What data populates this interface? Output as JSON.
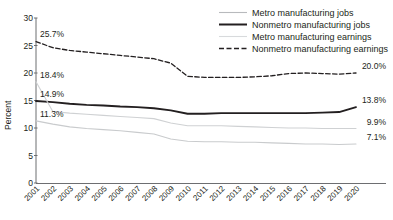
{
  "chart_data": {
    "type": "line",
    "title": "",
    "xlabel": "",
    "ylabel": "Percent",
    "ylim": [
      0,
      30
    ],
    "yticks": [
      0,
      5,
      10,
      15,
      20,
      25,
      30
    ],
    "grid": false,
    "legend_position": "top-right",
    "x": [
      2001,
      2002,
      2003,
      2004,
      2005,
      2006,
      2007,
      2008,
      2009,
      2010,
      2011,
      2012,
      2013,
      2014,
      2015,
      2016,
      2017,
      2018,
      2019,
      2020
    ],
    "series": [
      {
        "name": "Metro manufacturing jobs",
        "style": "solid-light-gray",
        "color": "#c9cbcd",
        "start_label": "11.3%",
        "end_label": "7.1%",
        "values": [
          11.3,
          10.7,
          10.2,
          9.9,
          9.7,
          9.5,
          9.2,
          8.9,
          8.0,
          7.6,
          7.5,
          7.5,
          7.4,
          7.4,
          7.3,
          7.2,
          7.1,
          7.1,
          7.0,
          7.1
        ]
      },
      {
        "name": "Nonmetro manufacturing jobs",
        "style": "solid-bold-black",
        "color": "#231f20",
        "start_label": "14.9%",
        "end_label": "13.8%",
        "values": [
          14.9,
          14.7,
          14.4,
          14.2,
          14.1,
          13.9,
          13.8,
          13.6,
          13.2,
          12.6,
          12.6,
          12.7,
          12.7,
          12.7,
          12.7,
          12.7,
          12.7,
          12.8,
          12.9,
          13.8
        ]
      },
      {
        "name": "Metro manufacturing earnings",
        "style": "solid-gray",
        "color": "#b3b5b8",
        "start_label": "18.4%",
        "end_label": "9.9%",
        "values": [
          18.4,
          13.0,
          12.7,
          12.5,
          12.3,
          12.1,
          11.9,
          11.7,
          10.9,
          10.4,
          10.4,
          10.4,
          10.3,
          10.2,
          10.1,
          10.0,
          10.0,
          9.9,
          9.9,
          9.9
        ]
      },
      {
        "name": "Nonmetro manufacturing earnings",
        "style": "dashed-black",
        "color": "#231f20",
        "start_label": "25.7%",
        "end_label": "20.0%",
        "values": [
          25.7,
          24.6,
          24.1,
          23.8,
          23.5,
          23.2,
          22.9,
          22.6,
          21.8,
          19.4,
          19.2,
          19.2,
          19.2,
          19.3,
          19.5,
          19.9,
          20.0,
          19.9,
          19.8,
          20.0
        ]
      }
    ]
  },
  "legend": {
    "items": [
      {
        "label": "Metro manufacturing jobs"
      },
      {
        "label": "Nonmetro manufacturing jobs"
      },
      {
        "label": "Metro manufacturing earnings"
      },
      {
        "label": "Nonmetro manufacturing earnings"
      }
    ]
  },
  "axes": {
    "y_title": "Percent",
    "y_ticks": [
      "30",
      "25",
      "20",
      "15",
      "10",
      "5",
      "0"
    ],
    "x_ticks": [
      "2001",
      "2002",
      "2003",
      "2004",
      "2005",
      "2006",
      "2007",
      "2008",
      "2009",
      "2010",
      "2011",
      "2012",
      "2013",
      "2014",
      "2015",
      "2016",
      "2017",
      "2018",
      "2019",
      "2020"
    ]
  },
  "annotations": {
    "left": [
      "25.7%",
      "18.4%",
      "14.9%",
      "11.3%"
    ],
    "right": [
      "20.0%",
      "13.8%",
      "9.9%",
      "7.1%"
    ]
  }
}
